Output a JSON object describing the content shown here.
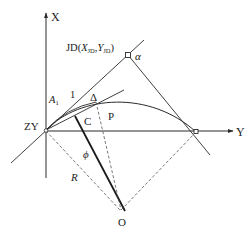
{
  "diagram": {
    "colors": {
      "line": "#2a2a2a",
      "dashed": "#555555",
      "background": "#ffffff"
    },
    "axes": {
      "x_axis_label": "X",
      "y_axis_label": "Y"
    },
    "labels": {
      "jd_prefix": "JD(",
      "jd_x": "X",
      "jd_x_sub": "JD",
      "jd_sep": ",",
      "jd_y": "Y",
      "jd_y_sub": "JD",
      "jd_suffix": ")",
      "alpha": "α",
      "a1": "A",
      "a1_sub": "1",
      "line_1": "1",
      "delta": "Δ",
      "c": "C",
      "p": "P",
      "zy": "ZY",
      "phi": "ϕ",
      "r": "R",
      "o": "O"
    }
  }
}
